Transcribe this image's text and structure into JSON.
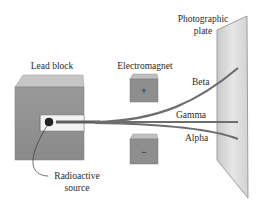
{
  "diagram": {
    "type": "physics-apparatus",
    "labels": {
      "lead_block": "Lead block",
      "electromagnet": "Electromagnet",
      "plate_line1": "Photographic",
      "plate_line2": "plate",
      "beta": "Beta",
      "gamma": "Gamma",
      "alpha": "Alpha",
      "source_line1": "Radioactive",
      "source_line2": "source"
    },
    "magnet_poles": {
      "top": "+",
      "bottom": "−"
    },
    "colors": {
      "block_front": "#8e8e8e",
      "block_top": "#c4c4c4",
      "block_side": "#a8a8a8",
      "beam": "#6a6a6a",
      "plate": "#dcdcdc",
      "text": "#2a2a2a"
    }
  }
}
